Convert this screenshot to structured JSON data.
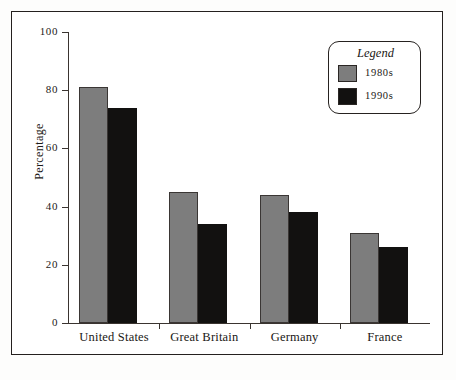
{
  "figure": {
    "background_color": "#ffffff",
    "frame_color": "#24201e"
  },
  "chart_data": {
    "type": "bar",
    "title": "",
    "xlabel": "",
    "ylabel": "Percentage",
    "ylim": [
      0,
      100
    ],
    "yticks": [
      0,
      20,
      40,
      60,
      80,
      100
    ],
    "ytick_labels": [
      "0",
      "20",
      "40",
      "60",
      "80",
      "100"
    ],
    "grid": false,
    "legend_position": "upper right",
    "legend_title": "Legend",
    "categories": [
      "United States",
      "Great Britain",
      "Germany",
      "France"
    ],
    "series": [
      {
        "name": "1980s",
        "color": "#7d7d7d",
        "values": [
          81,
          45,
          44,
          31
        ]
      },
      {
        "name": "1990s",
        "color": "#121110",
        "values": [
          74,
          34,
          38,
          26
        ]
      }
    ]
  },
  "axes": {
    "y_title": "Percentage",
    "y_tick_labels": [
      "100",
      "80",
      "60",
      "40",
      "20",
      "0"
    ],
    "x_tick_labels": [
      "United States",
      "Great Britain",
      "Germany",
      "France"
    ]
  },
  "legend": {
    "title": "Legend",
    "entries": [
      {
        "label": "1980s",
        "color": "#7d7d7d"
      },
      {
        "label": "1990s",
        "color": "#121110"
      }
    ]
  }
}
